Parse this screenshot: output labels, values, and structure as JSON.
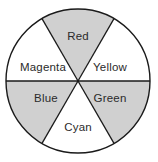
{
  "figure": {
    "type": "color-wheel-diagram",
    "background_color": "#ffffff",
    "outline_color": "#1a1a1a",
    "shaded_fill": "#d0d0d0",
    "unshaded_fill": "#ffffff",
    "label_color": "#2b2b2b",
    "center": {
      "x": 78,
      "y": 81
    },
    "radius": 72,
    "segment_count": 6,
    "segment_span_degrees": 60,
    "diameter_line": "horizontal"
  },
  "chart_data": {
    "type": "pie",
    "categories": [
      "Red",
      "Yellow",
      "Green",
      "Cyan",
      "Blue",
      "Magenta"
    ],
    "values": [
      1,
      1,
      1,
      1,
      1,
      1
    ],
    "legend_position": "none",
    "grid": false,
    "segments": [
      {
        "label": "Red",
        "start_angle": -30,
        "end_angle": 30,
        "mid_angle": 0,
        "shaded": true,
        "fill": "#d0d0d0",
        "label_x": 78,
        "label_y": 37
      },
      {
        "label": "Yellow",
        "start_angle": 30,
        "end_angle": 90,
        "mid_angle": 60,
        "shaded": false,
        "fill": "#ffffff",
        "label_x": 110,
        "label_y": 68
      },
      {
        "label": "Green",
        "start_angle": 90,
        "end_angle": 150,
        "mid_angle": 120,
        "shaded": true,
        "fill": "#d0d0d0",
        "label_x": 110,
        "label_y": 99
      },
      {
        "label": "Cyan",
        "start_angle": 150,
        "end_angle": 210,
        "mid_angle": 180,
        "shaded": false,
        "fill": "#ffffff",
        "label_x": 78,
        "label_y": 128
      },
      {
        "label": "Blue",
        "start_angle": 210,
        "end_angle": 270,
        "mid_angle": 240,
        "shaded": true,
        "fill": "#d0d0d0",
        "label_x": 46,
        "label_y": 99
      },
      {
        "label": "Magenta",
        "start_angle": 270,
        "end_angle": 330,
        "mid_angle": 300,
        "shaded": false,
        "fill": "#ffffff",
        "label_x": 43,
        "label_y": 68
      }
    ]
  }
}
